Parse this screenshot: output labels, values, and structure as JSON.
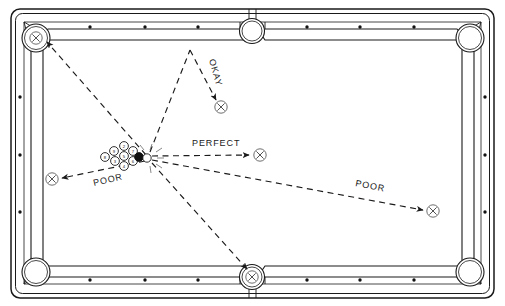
{
  "diagram": {
    "caption": "",
    "colors": {
      "line": "#1a1a1a",
      "rail_fill": "#ffffff",
      "cloth": "#ffffff",
      "dashed": "#2a2a2a",
      "black_ball": "#111111"
    },
    "table": {
      "rails": "outer cushion frame with six pockets",
      "diamond_count_long_rail": 6,
      "diamond_count_short_rail": 3,
      "pockets": [
        {
          "name": "top-left-corner-pocket",
          "x": 36,
          "y": 38
        },
        {
          "name": "top-side-pocket",
          "x": 252,
          "y": 31
        },
        {
          "name": "top-right-corner-pocket",
          "x": 470,
          "y": 38
        },
        {
          "name": "bottom-left-corner-pocket",
          "x": 36,
          "y": 272
        },
        {
          "name": "bottom-side-pocket",
          "x": 252,
          "y": 277
        },
        {
          "name": "bottom-right-corner-pocket",
          "x": 470,
          "y": 272
        }
      ]
    },
    "rack": {
      "label": "racked-balls",
      "balls": [
        "8",
        "9",
        "2",
        "7",
        "5",
        "4",
        "3",
        "6"
      ],
      "cue_ball_label": "cue-ball",
      "black_ball_label": "eight-ball"
    },
    "impact_point": {
      "x": 148,
      "y": 157,
      "label": "break-impact-point"
    },
    "paths": [
      {
        "id": "poor-left",
        "label": "POOR",
        "quality": "poor",
        "target": {
          "x": 52,
          "y": 179
        },
        "label_x": 94,
        "label_y": 186,
        "label_rotate": -13
      },
      {
        "id": "perfect-right",
        "label": "PERFECT",
        "quality": "perfect",
        "target": {
          "x": 260,
          "y": 155
        },
        "label_x": 192,
        "label_y": 146,
        "label_rotate": 0
      },
      {
        "id": "poor-right",
        "label": "POOR",
        "quality": "poor",
        "target": {
          "x": 433,
          "y": 211
        },
        "label_x": 355,
        "label_y": 186,
        "label_rotate": 11
      },
      {
        "id": "okay-bank",
        "label": "OKAY",
        "quality": "okay",
        "target": {
          "x": 221,
          "y": 107
        },
        "label_x": 209,
        "label_y": 60,
        "label_rotate": 74
      },
      {
        "id": "scratch-corner",
        "label": "",
        "quality": "scratch",
        "target": {
          "x": 40,
          "y": 41
        },
        "label_x": 0,
        "label_y": 0,
        "label_rotate": 0
      },
      {
        "id": "scratch-side",
        "label": "",
        "quality": "scratch",
        "target": {
          "x": 252,
          "y": 277
        },
        "label_x": 0,
        "label_y": 0,
        "label_rotate": 0
      }
    ],
    "target_marker_glyph": "X"
  }
}
